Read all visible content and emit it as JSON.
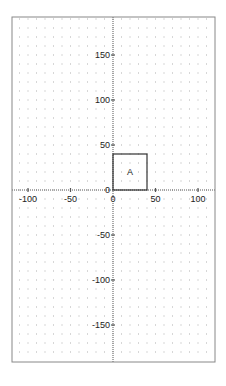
{
  "chart_data": {
    "type": "scatter",
    "title": "",
    "xlabel": "",
    "ylabel": "",
    "xlim": [
      -119,
      120
    ],
    "ylim": [
      -191,
      192
    ],
    "grid": true,
    "grid_style": "dotted",
    "grid_step": 10,
    "x_ticks": [
      -100,
      -50,
      0,
      50,
      100
    ],
    "x_tick_labels": [
      "-100",
      "-50",
      "0",
      "50",
      "100"
    ],
    "y_ticks": [
      150,
      100,
      50,
      0,
      -50,
      -100,
      -150
    ],
    "y_tick_labels": [
      "150",
      "100",
      "50",
      "0",
      "-50",
      "-100",
      "-150"
    ],
    "shapes": [
      {
        "type": "rectangle",
        "label": "A",
        "x0": 0,
        "y0": 0,
        "x1": 40,
        "y1": 40
      }
    ]
  },
  "layout": {
    "frame": {
      "left": 12,
      "top": 17,
      "right": 215,
      "bottom": 362
    },
    "origin_px": {
      "x": 113,
      "y": 190
    },
    "scale_px_per_unit": {
      "x": 0.85,
      "y": 0.9
    },
    "colors": {
      "frame": "#888888",
      "axis": "#555555",
      "grid_dot": "#b0b0b0",
      "shape_stroke": "#333333",
      "text": "#222222"
    }
  }
}
